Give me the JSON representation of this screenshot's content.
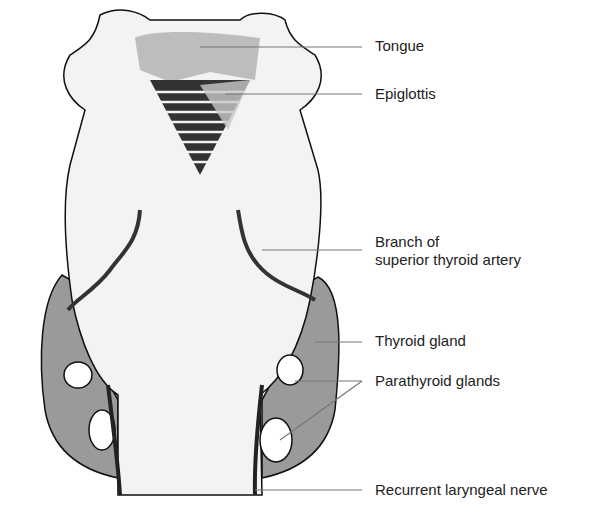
{
  "diagram": {
    "labels": [
      {
        "id": "tongue",
        "text": "Tongue",
        "x": 375,
        "y": 37
      },
      {
        "id": "epiglottis",
        "text": "Epiglottis",
        "x": 375,
        "y": 85
      },
      {
        "id": "branch",
        "line1": "Branch of",
        "line2": "superior thyroid artery",
        "x": 375,
        "y": 233
      },
      {
        "id": "thyroid",
        "text": "Thyroid gland",
        "x": 375,
        "y": 332
      },
      {
        "id": "parathyroid",
        "text": "Parathyroid glands",
        "x": 375,
        "y": 372
      },
      {
        "id": "nerve",
        "text": "Recurrent laryngeal nerve",
        "x": 375,
        "y": 490
      }
    ]
  }
}
